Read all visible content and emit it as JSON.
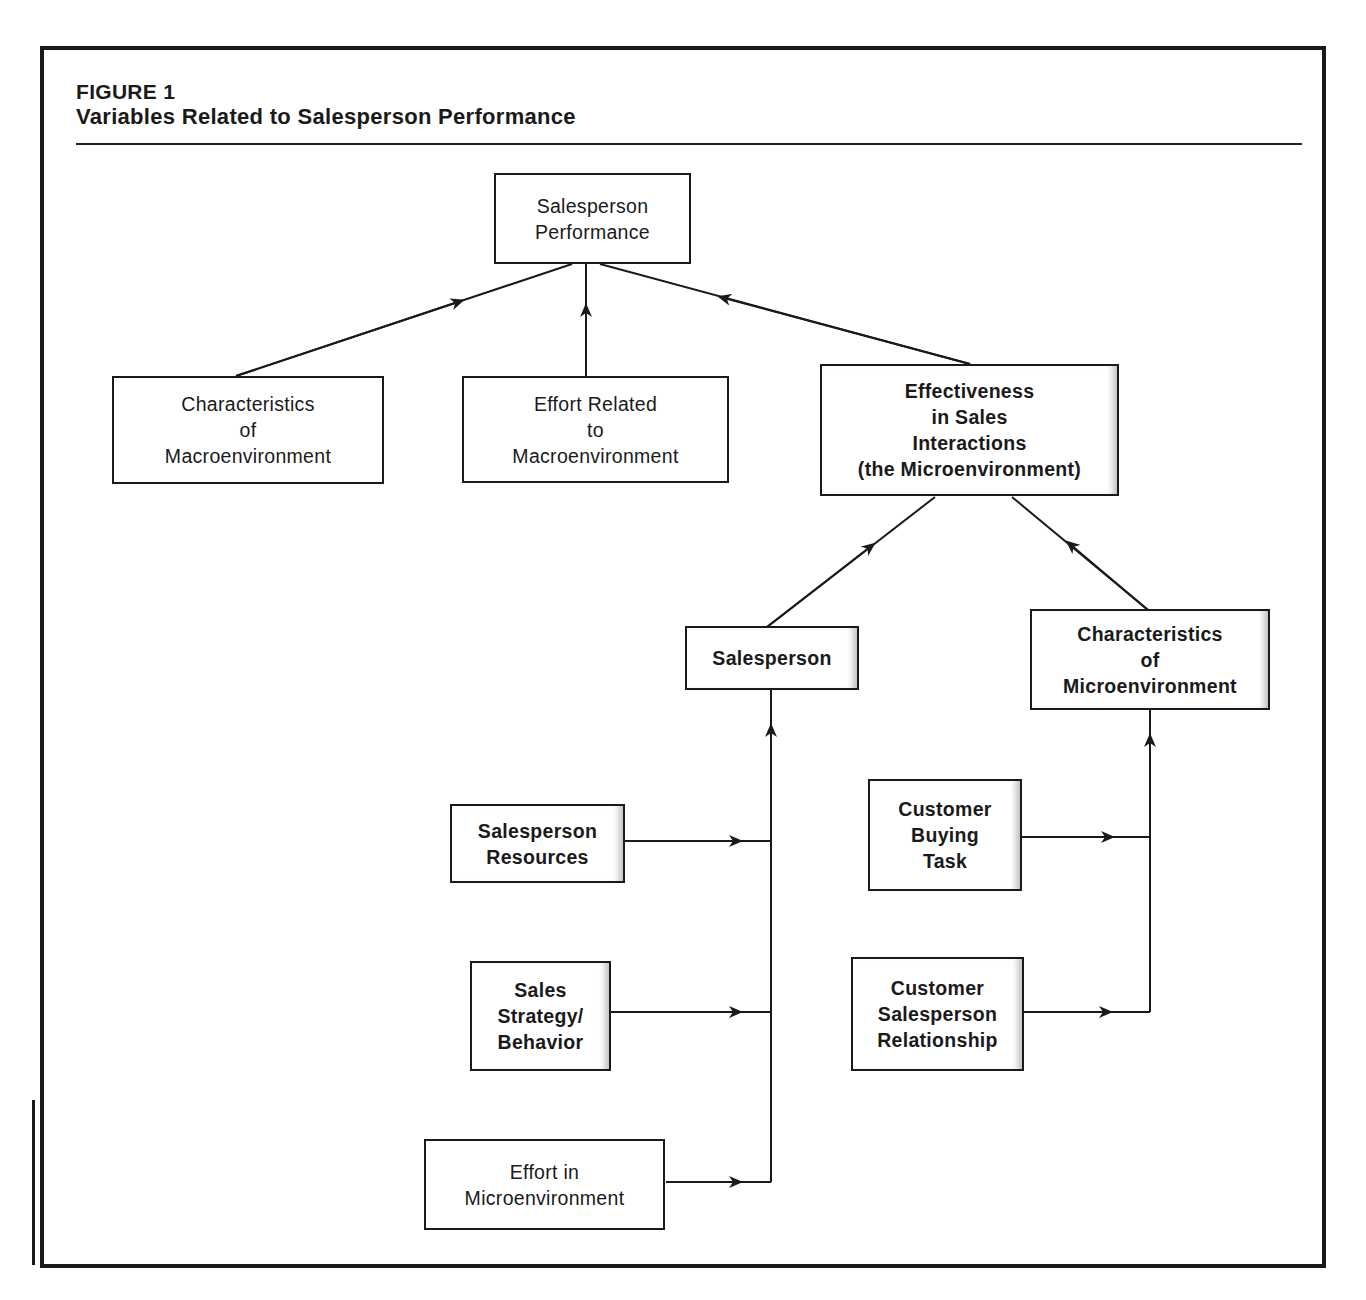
{
  "figure": {
    "label": "FIGURE 1",
    "title": "Variables Related to Salesperson Performance"
  },
  "nodes": {
    "performance": "Salesperson\nPerformance",
    "macro_characteristics": "Characteristics\nof\nMacroenvironment",
    "macro_effort": "Effort Related\nto\nMacroenvironment",
    "effectiveness": "Effectiveness\nin Sales\nInteractions\n(the Microenvironment)",
    "salesperson": "Salesperson",
    "micro_characteristics": "Characteristics\nof\nMicroenvironment",
    "resources": "Salesperson\nResources",
    "strategy": "Sales\nStrategy/\nBehavior",
    "micro_effort": "Effort in\nMicroenvironment",
    "buying_task": "Customer\nBuying\nTask",
    "relationship": "Customer\nSalesperson\nRelationship"
  },
  "edges": [
    {
      "from": "Characteristics of Macroenvironment",
      "to": "Salesperson Performance"
    },
    {
      "from": "Effort Related to Macroenvironment",
      "to": "Salesperson Performance"
    },
    {
      "from": "Effectiveness in Sales Interactions",
      "to": "Salesperson Performance"
    },
    {
      "from": "Salesperson",
      "to": "Effectiveness in Sales Interactions"
    },
    {
      "from": "Characteristics of Microenvironment",
      "to": "Effectiveness in Sales Interactions"
    },
    {
      "from": "Salesperson Resources",
      "to": "Salesperson"
    },
    {
      "from": "Sales Strategy/Behavior",
      "to": "Salesperson"
    },
    {
      "from": "Effort in Microenvironment",
      "to": "Salesperson"
    },
    {
      "from": "Customer Buying Task",
      "to": "Characteristics of Microenvironment"
    },
    {
      "from": "Customer Salesperson Relationship",
      "to": "Characteristics of Microenvironment"
    }
  ]
}
